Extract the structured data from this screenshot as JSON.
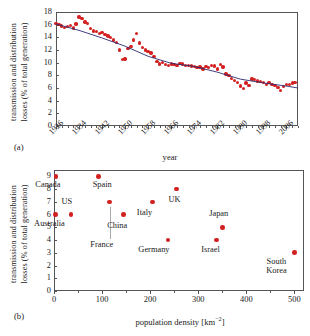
{
  "figure": {
    "panel_a_tag": "(a)",
    "panel_b_tag": "(b)"
  },
  "chart_data": [
    {
      "id": "panel_a",
      "type": "scatter",
      "title": "",
      "xlabel": "year",
      "ylabel": "transmission and distribution losses (% of total generation)",
      "ylabel_line1": "transmission and distribution",
      "ylabel_line2": "losses (% of total generation)",
      "xlim": [
        1926,
        2010
      ],
      "ylim": [
        0,
        18
      ],
      "xticks": [
        1926,
        1934,
        1942,
        1950,
        1958,
        1966,
        1974,
        1982,
        1990,
        1998,
        2006
      ],
      "yticks": [
        0,
        2,
        4,
        6,
        8,
        10,
        12,
        14,
        16,
        18
      ],
      "grid": false,
      "legend": "none",
      "series": [
        {
          "name": "US transmission and distribution losses",
          "marker": "circle",
          "color": "#d32020",
          "x": [
            1926,
            1927,
            1928,
            1929,
            1930,
            1931,
            1932,
            1933,
            1934,
            1935,
            1936,
            1937,
            1938,
            1939,
            1940,
            1941,
            1942,
            1943,
            1944,
            1945,
            1946,
            1947,
            1948,
            1949,
            1950,
            1951,
            1952,
            1953,
            1954,
            1955,
            1956,
            1957,
            1958,
            1959,
            1960,
            1961,
            1962,
            1963,
            1964,
            1965,
            1966,
            1967,
            1968,
            1969,
            1970,
            1971,
            1972,
            1973,
            1974,
            1975,
            1976,
            1977,
            1978,
            1979,
            1980,
            1981,
            1982,
            1983,
            1984,
            1985,
            1986,
            1987,
            1988,
            1989,
            1990,
            1991,
            1992,
            1993,
            1994,
            1995,
            1996,
            1997,
            1998,
            1999,
            2000,
            2001,
            2002,
            2003,
            2004,
            2005,
            2006,
            2007,
            2008,
            2009
          ],
          "y": [
            16.2,
            16.0,
            15.8,
            15.6,
            15.7,
            15.9,
            15.5,
            16.1,
            17.2,
            17.0,
            16.4,
            16.2,
            15.4,
            15.0,
            14.9,
            14.6,
            14.8,
            14.4,
            14.2,
            14.0,
            13.6,
            13.2,
            12.0,
            10.5,
            10.6,
            12.2,
            12.6,
            13.6,
            14.6,
            13.1,
            12.4,
            12.0,
            11.8,
            11.5,
            11.0,
            10.2,
            9.8,
            10.0,
            9.7,
            9.6,
            9.8,
            9.7,
            9.6,
            9.9,
            9.8,
            9.6,
            9.6,
            9.5,
            9.4,
            9.2,
            9.3,
            9.0,
            9.4,
            9.2,
            9.6,
            9.5,
            9.0,
            9.7,
            9.3,
            8.2,
            8.0,
            7.5,
            7.2,
            6.9,
            6.3,
            5.9,
            6.8,
            6.4,
            7.4,
            7.3,
            7.1,
            7.0,
            6.9,
            6.6,
            6.9,
            6.6,
            6.4,
            6.1,
            5.6,
            6.2,
            6.6,
            6.6,
            6.8,
            6.9
          ]
        }
      ],
      "trendline": {
        "name": "fitted trend",
        "color": "#2a2a6e",
        "x": [
          1926,
          1934,
          1942,
          1950,
          1958,
          1966,
          1974,
          1982,
          1990,
          1998,
          2006,
          2010
        ],
        "y": [
          16.1,
          15.1,
          13.9,
          12.6,
          11.0,
          9.9,
          9.4,
          8.5,
          7.4,
          6.8,
          6.3,
          6.0
        ]
      }
    },
    {
      "id": "panel_b",
      "type": "scatter",
      "title": "",
      "xlabel": "population density [km−2]",
      "xlabel_text": "population density [km",
      "xlabel_sup": "−2",
      "xlabel_tail": "]",
      "ylabel": "transmission and distribution losses (% of total generation)",
      "ylabel_line1": "transmission and distribution",
      "ylabel_line2": "losses (% of total generation)",
      "xlim": [
        0,
        520
      ],
      "ylim": [
        0,
        9.5
      ],
      "xticks": [
        0,
        100,
        200,
        300,
        400,
        500
      ],
      "yticks": [
        0,
        1,
        2,
        3,
        4,
        5,
        6,
        7,
        8,
        9
      ],
      "grid": false,
      "legend": "none",
      "points": [
        {
          "label": "Canada",
          "x": 4,
          "y": 9,
          "label_dx": -8,
          "label_dy": 10,
          "lines": [
            "Canada"
          ]
        },
        {
          "label": "Australia",
          "x": 3,
          "y": 6,
          "label_dx": -6,
          "label_dy": 10,
          "lines": [
            "Australia"
          ]
        },
        {
          "label": "US",
          "x": 35,
          "y": 6,
          "label_dx": -4,
          "label_dy": -12,
          "lines": [
            "US"
          ]
        },
        {
          "label": "Spain",
          "x": 92,
          "y": 9,
          "label_dx": 4,
          "label_dy": 10,
          "lines": [
            "Spain"
          ]
        },
        {
          "label": "France",
          "x": 116,
          "y": 7,
          "label_dx": -8,
          "label_dy": 44,
          "lines": [
            "France"
          ]
        },
        {
          "label": "China",
          "x": 144,
          "y": 6,
          "label_dx": -6,
          "label_dy": 12,
          "lines": [
            "China"
          ]
        },
        {
          "label": "Italy",
          "x": 205,
          "y": 7,
          "label_dx": -8,
          "label_dy": 12,
          "lines": [
            "Italy"
          ]
        },
        {
          "label": "UK",
          "x": 255,
          "y": 8,
          "label_dx": -2,
          "label_dy": 12,
          "lines": [
            "UK"
          ]
        },
        {
          "label": "Germany",
          "x": 237,
          "y": 4,
          "label_dx": -14,
          "label_dy": 11,
          "lines": [
            "Germany"
          ]
        },
        {
          "label": "Israel",
          "x": 338,
          "y": 4,
          "label_dx": -6,
          "label_dy": 11,
          "lines": [
            "Israel"
          ]
        },
        {
          "label": "Japan",
          "x": 351,
          "y": 5,
          "label_dx": -4,
          "label_dy": -12,
          "lines": [
            "Japan"
          ]
        },
        {
          "label": "South Korea",
          "x": 500,
          "y": 3,
          "label_dx": -18,
          "label_dy": 10,
          "lines": [
            "South",
            "Korea"
          ]
        }
      ]
    }
  ]
}
